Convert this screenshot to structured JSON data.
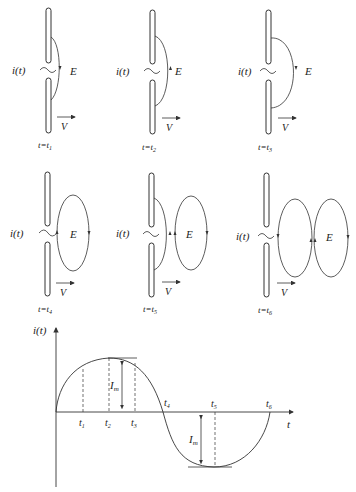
{
  "panels": [
    {
      "time_label": "t=t",
      "sub": "1",
      "current_label": "i(t)",
      "field_label": "E",
      "velocity_label": "V"
    },
    {
      "time_label": "t=t",
      "sub": "2",
      "current_label": "i(t)",
      "field_label": "E",
      "velocity_label": "V"
    },
    {
      "time_label": "t=t",
      "sub": "3",
      "current_label": "i(t)",
      "field_label": "E",
      "velocity_label": "V"
    },
    {
      "time_label": "t=t",
      "sub": "4",
      "current_label": "i(t)",
      "field_label": "E",
      "velocity_label": "V"
    },
    {
      "time_label": "t=t",
      "sub": "5",
      "current_label": "i(t)",
      "field_label": "E",
      "velocity_label": "V"
    },
    {
      "time_label": "t=t",
      "sub": "6",
      "current_label": "i(t)",
      "field_label": "E",
      "velocity_label": "V"
    }
  ],
  "graph": {
    "ylabel": "i(t)",
    "xlabel": "t",
    "amplitude_label": "I",
    "amplitude_sub": "m",
    "ticks": [
      {
        "t": "t",
        "sub": "1"
      },
      {
        "t": "t",
        "sub": "2"
      },
      {
        "t": "t",
        "sub": "3"
      },
      {
        "t": "t",
        "sub": "4"
      },
      {
        "t": "t",
        "sub": "5"
      },
      {
        "t": "t",
        "sub": "6"
      }
    ]
  },
  "colors": {
    "line": "#333333",
    "text": "#222222",
    "background": "#ffffff"
  }
}
